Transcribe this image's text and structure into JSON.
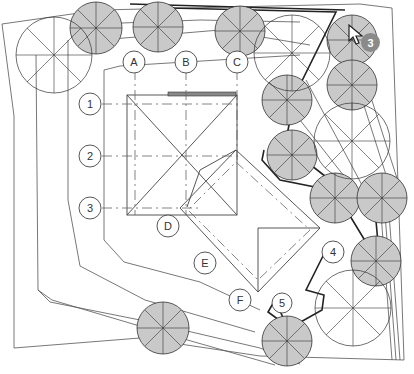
{
  "drawing": {
    "type": "site-plan",
    "grid_columns": [
      "A",
      "B",
      "C",
      "D",
      "E",
      "F"
    ],
    "grid_rows": [
      "1",
      "2",
      "3"
    ],
    "callouts": [
      "4",
      "5"
    ],
    "cursor_badge": "3"
  },
  "colors": {
    "tree_fill": "#c9c9c9",
    "line": "#444444",
    "badge": "#8a8a8a",
    "background": "#ffffff"
  }
}
